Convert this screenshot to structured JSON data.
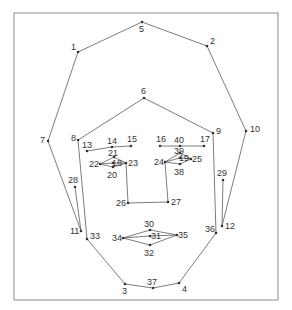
{
  "chart_data": {
    "type": "diagram",
    "title": "",
    "points": [
      {
        "id": "1",
        "x": 78,
        "y": 52
      },
      {
        "id": "2",
        "x": 207,
        "y": 46
      },
      {
        "id": "3",
        "x": 125,
        "y": 284
      },
      {
        "id": "4",
        "x": 179,
        "y": 283
      },
      {
        "id": "5",
        "x": 142,
        "y": 22
      },
      {
        "id": "6",
        "x": 144,
        "y": 98
      },
      {
        "id": "7",
        "x": 48,
        "y": 141
      },
      {
        "id": "8",
        "x": 78,
        "y": 140
      },
      {
        "id": "9",
        "x": 213,
        "y": 133
      },
      {
        "id": "10",
        "x": 246,
        "y": 131
      },
      {
        "id": "11",
        "x": 81,
        "y": 231
      },
      {
        "id": "12",
        "x": 222,
        "y": 226
      },
      {
        "id": "13",
        "x": 87,
        "y": 151
      },
      {
        "id": "14",
        "x": 112,
        "y": 147
      },
      {
        "id": "15",
        "x": 131,
        "y": 146
      },
      {
        "id": "16",
        "x": 160,
        "y": 146
      },
      {
        "id": "17",
        "x": 204,
        "y": 146
      },
      {
        "id": "18",
        "x": 113,
        "y": 163
      },
      {
        "id": "19",
        "x": 180,
        "y": 158
      },
      {
        "id": "20",
        "x": 113,
        "y": 167
      },
      {
        "id": "21",
        "x": 114,
        "y": 157
      },
      {
        "id": "22",
        "x": 100,
        "y": 164
      },
      {
        "id": "23",
        "x": 126,
        "y": 163
      },
      {
        "id": "24",
        "x": 165,
        "y": 162
      },
      {
        "id": "25",
        "x": 191,
        "y": 159
      },
      {
        "id": "26",
        "x": 128,
        "y": 203
      },
      {
        "id": "27",
        "x": 168,
        "y": 202
      },
      {
        "id": "28",
        "x": 75,
        "y": 187
      },
      {
        "id": "29",
        "x": 223,
        "y": 180
      },
      {
        "id": "30",
        "x": 150,
        "y": 230
      },
      {
        "id": "31",
        "x": 150,
        "y": 236
      },
      {
        "id": "32",
        "x": 150,
        "y": 245
      },
      {
        "id": "33",
        "x": 87,
        "y": 239
      },
      {
        "id": "34",
        "x": 123,
        "y": 238
      },
      {
        "id": "35",
        "x": 177,
        "y": 235
      },
      {
        "id": "36",
        "x": 216,
        "y": 233
      },
      {
        "id": "37",
        "x": 153,
        "y": 288
      },
      {
        "id": "38",
        "x": 180,
        "y": 164
      },
      {
        "id": "39",
        "x": 180,
        "y": 153
      },
      {
        "id": "40",
        "x": 180,
        "y": 146
      }
    ],
    "edges": [
      [
        "5",
        "1"
      ],
      [
        "5",
        "2"
      ],
      [
        "1",
        "7"
      ],
      [
        "2",
        "10"
      ],
      [
        "7",
        "11"
      ],
      [
        "10",
        "12"
      ],
      [
        "6",
        "8"
      ],
      [
        "6",
        "9"
      ],
      [
        "8",
        "33"
      ],
      [
        "9",
        "36"
      ],
      [
        "33",
        "3"
      ],
      [
        "36",
        "4"
      ],
      [
        "3",
        "37"
      ],
      [
        "37",
        "4"
      ],
      [
        "28",
        "11"
      ],
      [
        "29",
        "12"
      ],
      [
        "13",
        "14"
      ],
      [
        "14",
        "15"
      ],
      [
        "16",
        "40"
      ],
      [
        "40",
        "17"
      ],
      [
        "22",
        "21"
      ],
      [
        "21",
        "23"
      ],
      [
        "22",
        "20"
      ],
      [
        "20",
        "23"
      ],
      [
        "22",
        "18"
      ],
      [
        "18",
        "23"
      ],
      [
        "24",
        "39"
      ],
      [
        "39",
        "25"
      ],
      [
        "24",
        "38"
      ],
      [
        "38",
        "25"
      ],
      [
        "24",
        "19"
      ],
      [
        "19",
        "25"
      ],
      [
        "23",
        "26"
      ],
      [
        "24",
        "27"
      ],
      [
        "26",
        "27"
      ],
      [
        "34",
        "30"
      ],
      [
        "30",
        "35"
      ],
      [
        "34",
        "32"
      ],
      [
        "32",
        "35"
      ],
      [
        "34",
        "31"
      ],
      [
        "31",
        "35"
      ]
    ],
    "label_offsets_note": "labels placed near their points"
  }
}
